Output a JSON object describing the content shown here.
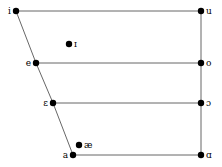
{
  "chart_data": {
    "type": "scatter",
    "title": "",
    "subtitle": "",
    "xlabel": "",
    "ylabel": "",
    "xlim": [
      0,
      222
    ],
    "ylim": [
      167,
      0
    ],
    "grid": false,
    "legend": null,
    "axis_note": "x = front-to-back tongue position (left = front), y = vowel height (top = close)",
    "points": [
      {
        "label": "i",
        "x": 16,
        "y": 11,
        "label_side": "left",
        "on_outline": true,
        "height": "close",
        "backness": "front"
      },
      {
        "label": "u",
        "x": 201,
        "y": 11,
        "label_side": "right",
        "on_outline": true,
        "height": "close",
        "backness": "back"
      },
      {
        "label": "ɪ",
        "x": 69,
        "y": 44,
        "label_side": "right",
        "on_outline": false,
        "height": "near-close",
        "backness": "near-front"
      },
      {
        "label": "e",
        "x": 36,
        "y": 63,
        "label_side": "left",
        "on_outline": true,
        "height": "close-mid",
        "backness": "front"
      },
      {
        "label": "o",
        "x": 201,
        "y": 63,
        "label_side": "right",
        "on_outline": true,
        "height": "close-mid",
        "backness": "back"
      },
      {
        "label": "ɛ",
        "x": 53,
        "y": 103,
        "label_side": "left",
        "on_outline": true,
        "height": "open-mid",
        "backness": "front"
      },
      {
        "label": "ɔ",
        "x": 201,
        "y": 103,
        "label_side": "right",
        "on_outline": true,
        "height": "open-mid",
        "backness": "back"
      },
      {
        "label": "æ",
        "x": 79,
        "y": 145,
        "label_side": "right",
        "on_outline": false,
        "height": "near-open",
        "backness": "front"
      },
      {
        "label": "a",
        "x": 73,
        "y": 155,
        "label_side": "left",
        "on_outline": true,
        "height": "open",
        "backness": "front"
      },
      {
        "label": "ɑ",
        "x": 201,
        "y": 155,
        "label_side": "right",
        "on_outline": true,
        "height": "open",
        "backness": "back"
      }
    ],
    "lines": [
      {
        "name": "top-edge",
        "from": "i",
        "to": "u"
      },
      {
        "name": "bottom-edge",
        "from": "a",
        "to": "ɑ"
      },
      {
        "name": "right-edge",
        "from": "u",
        "to": "ɑ"
      },
      {
        "name": "left-edge-upper",
        "from": "i",
        "to": "e"
      },
      {
        "name": "left-edge-mid",
        "from": "e",
        "to": "ɛ"
      },
      {
        "name": "left-edge-lower",
        "from": "ɛ",
        "to": "a"
      },
      {
        "name": "close-mid-line",
        "from": "e",
        "to": "o"
      },
      {
        "name": "open-mid-line",
        "from": "ɛ",
        "to": "ɔ"
      }
    ],
    "style": {
      "line_color": "#555555",
      "point_color": "#000000",
      "text_color": "#000000",
      "background": "#ffffff",
      "point_radius": 3.2,
      "line_width": 0.9
    }
  }
}
